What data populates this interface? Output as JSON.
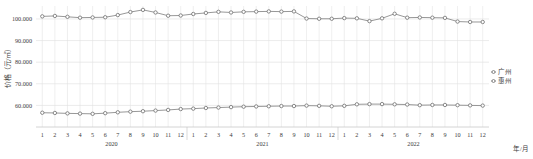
{
  "chart_data": {
    "type": "line",
    "title": "",
    "xlabel": "年/月",
    "ylabel": "价格（元/㎡）",
    "ylim": [
      50000,
      106000
    ],
    "yticks": [
      60000,
      70000,
      80000,
      90000,
      100000
    ],
    "ytick_labels": [
      "60.000",
      "70.000",
      "80.000",
      "90.000",
      "100.000"
    ],
    "grid": true,
    "legend_position": "right",
    "x_groups": [
      {
        "label": "2020",
        "months": [
          "1",
          "2",
          "3",
          "4",
          "5",
          "6",
          "7",
          "8",
          "9",
          "10",
          "11",
          "12"
        ]
      },
      {
        "label": "2021",
        "months": [
          "1",
          "2",
          "3",
          "4",
          "5",
          "6",
          "7",
          "8",
          "9",
          "10",
          "11",
          "12"
        ]
      },
      {
        "label": "2022",
        "months": [
          "1",
          "2",
          "3",
          "4",
          "5",
          "6",
          "7",
          "8",
          "9",
          "10",
          "11",
          "12"
        ]
      }
    ],
    "x": [
      "2020-1",
      "2020-2",
      "2020-3",
      "2020-4",
      "2020-5",
      "2020-6",
      "2020-7",
      "2020-8",
      "2020-9",
      "2020-10",
      "2020-11",
      "2020-12",
      "2021-1",
      "2021-2",
      "2021-3",
      "2021-4",
      "2021-5",
      "2021-6",
      "2021-7",
      "2021-8",
      "2021-9",
      "2021-10",
      "2021-11",
      "2021-12",
      "2022-1",
      "2022-2",
      "2022-3",
      "2022-4",
      "2022-5",
      "2022-6",
      "2022-7",
      "2022-8",
      "2022-9",
      "2022-10",
      "2022-11",
      "2022-12"
    ],
    "series": [
      {
        "name": "广州",
        "color": "#8c8c8c",
        "marker": "circle",
        "values": [
          101200,
          101400,
          101000,
          100600,
          100700,
          100800,
          101800,
          103200,
          104200,
          103000,
          101500,
          101600,
          102300,
          102800,
          103300,
          103000,
          103300,
          103400,
          103500,
          103400,
          103500,
          100200,
          100100,
          100100,
          100400,
          100300,
          99000,
          100300,
          102400,
          100600,
          100700,
          100600,
          100500,
          98800,
          98600,
          98600
        ]
      },
      {
        "name": "惠州",
        "color": "#8c8c8c",
        "marker": "circle",
        "values": [
          56600,
          56500,
          56300,
          56200,
          56100,
          56400,
          56800,
          57100,
          57300,
          57600,
          57900,
          58300,
          58500,
          58800,
          59000,
          59200,
          59400,
          59500,
          59600,
          59700,
          59700,
          59900,
          59800,
          59600,
          59800,
          60500,
          60600,
          60600,
          60500,
          60400,
          60100,
          60200,
          60200,
          60100,
          60000,
          59900
        ]
      }
    ]
  },
  "legend": {
    "items": [
      {
        "label": "广州"
      },
      {
        "label": "惠州"
      }
    ]
  },
  "colors": {
    "line": "#8c8c8c",
    "marker": "#6e6e6e",
    "grid": "#e2e2e2",
    "text": "#3c3c3c"
  }
}
